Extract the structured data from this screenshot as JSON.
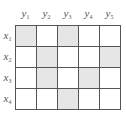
{
  "diagram": {
    "type": "relation-matrix",
    "shade_color": "#e6e6e6",
    "line_color": "#555555",
    "columns": [
      {
        "var": "y",
        "sub": "1"
      },
      {
        "var": "y",
        "sub": "2"
      },
      {
        "var": "y",
        "sub": "3"
      },
      {
        "var": "y",
        "sub": "4"
      },
      {
        "var": "y",
        "sub": "5"
      }
    ],
    "rows": [
      {
        "var": "x",
        "sub": "1",
        "cells": [
          1,
          0,
          1,
          0,
          0
        ]
      },
      {
        "var": "x",
        "sub": "2",
        "cells": [
          0,
          1,
          0,
          0,
          1
        ]
      },
      {
        "var": "x",
        "sub": "3",
        "cells": [
          0,
          1,
          0,
          1,
          0
        ]
      },
      {
        "var": "x",
        "sub": "4",
        "cells": [
          0,
          0,
          1,
          0,
          0
        ]
      }
    ]
  }
}
